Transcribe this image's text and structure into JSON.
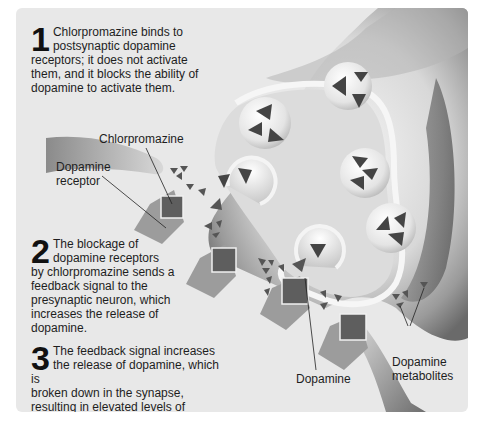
{
  "figure": {
    "top_cut_text": "...",
    "steps": [
      {
        "number": "1",
        "text_line1": "Chlorpromazine binds to",
        "text_line2": "postsynaptic dopamine",
        "text_rest": "receptors; it does not activate them, and it blocks the ability of dopamine to activate them."
      },
      {
        "number": "2",
        "text_line1": "The blockage of",
        "text_line2": "dopamine receptors",
        "text_rest": "by chlorpromazine sends a feedback signal to the presynaptic neuron, which increases the release of dopamine."
      },
      {
        "number": "3",
        "text_line1": "The feedback signal increases",
        "text_line2": "the release of dopamine, which is",
        "text_rest": "broken down in the synapse, resulting in elevated levels of dopamine metabolites."
      }
    ],
    "labels": {
      "chlorpromazine": "Chlorpromazine",
      "dopamine_receptor_l1": "Dopamine",
      "dopamine_receptor_l2": "receptor",
      "dopamine": "Dopamine",
      "metabolites_l1": "Dopamine",
      "metabolites_l2": "metabolites"
    },
    "colors": {
      "panel_bg": "#e8e8e8",
      "neuron_dark": "#6a6a6a",
      "neuron_light": "#f2f2f2",
      "receptor": "#9a9a9a",
      "chlorpromazine": "#5e5e5e",
      "dopamine": "#4a4a4a"
    }
  }
}
